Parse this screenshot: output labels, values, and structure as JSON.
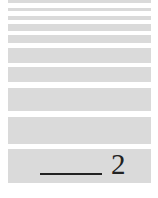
{
  "bands": [
    {
      "top": 0,
      "height": 3
    },
    {
      "top": 8,
      "height": 3
    },
    {
      "top": 16,
      "height": 4
    },
    {
      "top": 24,
      "height": 7
    },
    {
      "top": 35,
      "height": 8
    },
    {
      "top": 48,
      "height": 15
    },
    {
      "top": 67,
      "height": 15
    },
    {
      "top": 88,
      "height": 23
    },
    {
      "top": 117,
      "height": 27
    },
    {
      "top": 149,
      "height": 34
    }
  ],
  "colors": {
    "band": "#dadada",
    "ink": "#222222"
  },
  "label": {
    "number": "2"
  }
}
